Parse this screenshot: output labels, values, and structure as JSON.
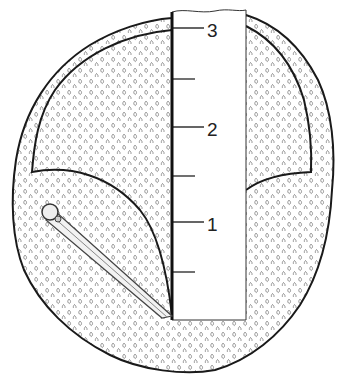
{
  "diagram": {
    "ruler": {
      "labels": [
        {
          "text": "3",
          "y": 30
        },
        {
          "text": "2",
          "y": 129
        },
        {
          "text": "1",
          "y": 224
        }
      ],
      "major_ticks_y": [
        28,
        127,
        222
      ],
      "minor_ticks_y": [
        79,
        176,
        272
      ]
    },
    "colors": {
      "outline": "#1a1a1a",
      "fill_pattern": "#8a8a8a",
      "background": "#ffffff"
    }
  }
}
